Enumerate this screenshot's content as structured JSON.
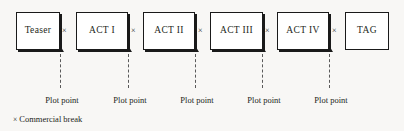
{
  "diagram": {
    "boxes": [
      {
        "label": "Teaser",
        "x": 16,
        "y": 12,
        "w": 44,
        "h": 38,
        "shadow": true
      },
      {
        "label": "ACT I",
        "x": 76,
        "y": 12,
        "w": 52,
        "h": 38,
        "shadow": true
      },
      {
        "label": "ACT II",
        "x": 143,
        "y": 12,
        "w": 52,
        "h": 38,
        "shadow": true
      },
      {
        "label": "ACT III",
        "x": 210,
        "y": 12,
        "w": 53,
        "h": 38,
        "shadow": true
      },
      {
        "label": "ACT IV",
        "x": 277,
        "y": 12,
        "w": 52,
        "h": 38,
        "shadow": true
      },
      {
        "label": "TAG",
        "x": 345,
        "y": 12,
        "w": 44,
        "h": 38,
        "shadow": false
      }
    ],
    "breaks": [
      {
        "mark": "×",
        "x": 62,
        "y": 27
      },
      {
        "mark": "×",
        "x": 131,
        "y": 27
      },
      {
        "mark": "×",
        "x": 198,
        "y": 27
      },
      {
        "mark": "×",
        "x": 265,
        "y": 27
      },
      {
        "mark": "×",
        "x": 332,
        "y": 27
      }
    ],
    "connectors": [
      {
        "x": 60,
        "top": 54,
        "height": 34
      },
      {
        "x": 128,
        "top": 54,
        "height": 34
      },
      {
        "x": 195,
        "top": 54,
        "height": 34
      },
      {
        "x": 262,
        "top": 54,
        "height": 34
      },
      {
        "x": 329,
        "top": 54,
        "height": 34
      }
    ],
    "arrowheads": [
      {
        "x": 60,
        "y": 47
      },
      {
        "x": 128,
        "y": 47
      },
      {
        "x": 195,
        "y": 47
      },
      {
        "x": 262,
        "y": 47
      },
      {
        "x": 329,
        "y": 47
      }
    ],
    "plot_points": [
      {
        "label": "Plot point",
        "x": 62,
        "y": 96
      },
      {
        "label": "Plot point",
        "x": 130,
        "y": 96
      },
      {
        "label": "Plot point",
        "x": 197,
        "y": 96
      },
      {
        "label": "Plot point",
        "x": 264,
        "y": 96
      },
      {
        "label": "Plot point",
        "x": 331,
        "y": 96
      }
    ],
    "legend": {
      "mark": "×",
      "text": "Commercial break"
    },
    "colors": {
      "background": "#f8f7f5",
      "box_fill": "#ffffff",
      "stroke": "#1a1a1a",
      "text": "#231f20",
      "dash": "#5a5a5a"
    }
  }
}
